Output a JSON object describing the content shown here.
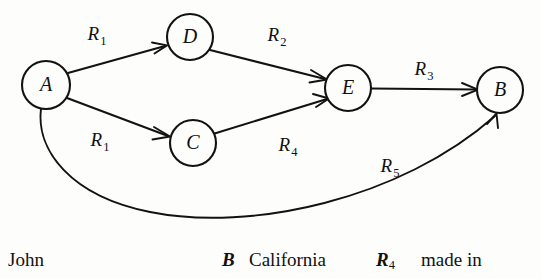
{
  "diagram": {
    "background_color": "#fdfdfb",
    "stroke_color": "#121212",
    "nodes": [
      {
        "id": "A",
        "label": "A",
        "cx": 46,
        "cy": 85,
        "r": 24
      },
      {
        "id": "D",
        "label": "D",
        "cx": 190,
        "cy": 37,
        "r": 23
      },
      {
        "id": "C",
        "label": "C",
        "cx": 193,
        "cy": 143,
        "r": 23
      },
      {
        "id": "E",
        "label": "E",
        "cx": 348,
        "cy": 88,
        "r": 23
      },
      {
        "id": "B",
        "label": "B",
        "cx": 500,
        "cy": 90,
        "r": 23
      }
    ],
    "edges": [
      {
        "id": "A-D",
        "from": "A",
        "to": "D",
        "label_base": "R",
        "label_sub": "1",
        "label_x": 97,
        "label_y": 40
      },
      {
        "id": "D-E",
        "from": "D",
        "to": "E",
        "label_base": "R",
        "label_sub": "2",
        "label_x": 277,
        "label_y": 41
      },
      {
        "id": "A-C",
        "from": "A",
        "to": "C",
        "label_base": "R",
        "label_sub": "1",
        "label_x": 100,
        "label_y": 146
      },
      {
        "id": "C-E",
        "from": "C",
        "to": "E",
        "label_base": "R",
        "label_sub": "4",
        "label_x": 288,
        "label_y": 151
      },
      {
        "id": "E-B",
        "from": "E",
        "to": "B",
        "label_base": "R",
        "label_sub": "3",
        "label_x": 424,
        "label_y": 75
      },
      {
        "id": "A-B",
        "from": "A",
        "to": "B",
        "label_base": "R",
        "label_sub": "5",
        "label_x": 390,
        "label_y": 172
      }
    ]
  },
  "caption": {
    "items": [
      {
        "id": "john",
        "text": "John",
        "style": "roman",
        "x": 8,
        "y": 10
      },
      {
        "id": "entity-b",
        "text": "B",
        "style": "italic",
        "x": 222,
        "y": 10
      },
      {
        "id": "california",
        "text": "California",
        "style": "roman",
        "x": 249,
        "y": 10
      },
      {
        "id": "relation-r4",
        "text": "R",
        "sub": "4",
        "style": "italic",
        "x": 376,
        "y": 10
      },
      {
        "id": "made-in",
        "text": "made in",
        "style": "roman",
        "x": 421,
        "y": 10
      }
    ]
  }
}
